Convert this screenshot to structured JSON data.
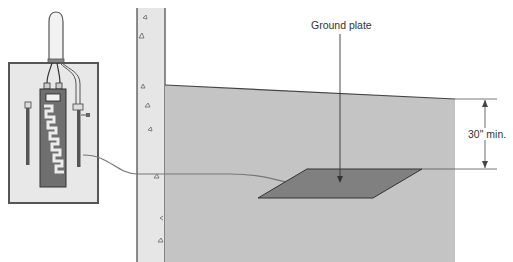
{
  "labels": {
    "ground_plate": "Ground plate",
    "depth": "30\" min."
  },
  "colors": {
    "soil": "#c4c4c4",
    "wall": "#e6e6e6",
    "plate": "#808080",
    "panel_fill": "#e8e8e8",
    "panel_border": "#555555",
    "breaker_bus": "#6f6f6f",
    "line": "#444444"
  }
}
